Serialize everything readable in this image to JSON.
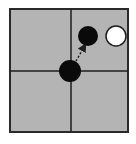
{
  "diagram": {
    "type": "go-board-fragment",
    "board": {
      "x": 10,
      "y": 9,
      "width": 118,
      "height": 123,
      "fill": "#b4b4b4",
      "border": "#2a2a2a"
    },
    "grid_lines": {
      "vertical_x": 71,
      "horizontal_y": 71,
      "color": "#1e1e1e"
    },
    "stones": [
      {
        "id": "center-black",
        "color": "black",
        "cx": 70,
        "cy": 71,
        "r": 11
      },
      {
        "id": "upper-black",
        "color": "black",
        "cx": 88,
        "cy": 36,
        "r": 10
      },
      {
        "id": "upper-white",
        "color": "white",
        "cx": 116,
        "cy": 36,
        "r": 10
      }
    ],
    "arrow": {
      "from": [
        76,
        61
      ],
      "to": [
        84,
        47
      ],
      "style": "dashed",
      "color": "#1e1e1e"
    },
    "colors": {
      "black_stone": "#0a0a0a",
      "white_stone": "#ffffff",
      "white_stone_outline": "#1e1e1e"
    }
  }
}
